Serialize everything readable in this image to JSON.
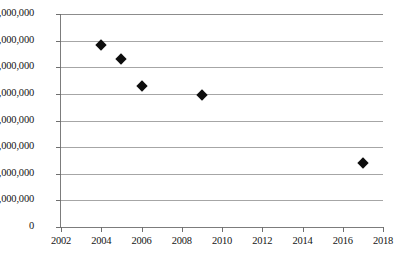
{
  "chart_data": {
    "type": "scatter",
    "title": "",
    "subtitle": "",
    "xlabel": "",
    "ylabel": "",
    "x": [
      2004,
      2005,
      2006,
      2009,
      2017
    ],
    "values": [
      13700000,
      12600000,
      10600000,
      9900000,
      4800000
    ],
    "series": [
      {
        "name": "",
        "points": [
          {
            "x": 2004,
            "y": 13700000
          },
          {
            "x": 2005,
            "y": 12600000
          },
          {
            "x": 2006,
            "y": 10600000
          },
          {
            "x": 2009,
            "y": 9900000
          },
          {
            "x": 2017,
            "y": 4800000
          }
        ]
      }
    ],
    "xlim": [
      2002,
      2018
    ],
    "ylim": [
      0,
      16000000
    ],
    "x_ticks": [
      2002,
      2004,
      2006,
      2008,
      2010,
      2012,
      2014,
      2016,
      2018
    ],
    "x_tick_labels": [
      "2002",
      "2004",
      "2006",
      "2008",
      "2010",
      "2012",
      "2014",
      "2016",
      "2018"
    ],
    "y_ticks": [
      0,
      2000000,
      4000000,
      6000000,
      8000000,
      10000000,
      12000000,
      14000000,
      16000000
    ],
    "y_tick_labels": [
      "0",
      "2,000,000",
      "4,000,000",
      "6,000,000",
      "8,000,000",
      "10,000,000",
      "12,000,000",
      "14,000,000",
      "16,000,000"
    ],
    "grid": true,
    "grid_axis": "y",
    "legend": false,
    "legend_position": "none",
    "marker_shape": "diamond",
    "marker_color": "#0d0d0d",
    "gridline_color": "#a6a6a6",
    "axis_color": "#7c7c7c",
    "background_color": "#ffffff",
    "annotations": []
  }
}
